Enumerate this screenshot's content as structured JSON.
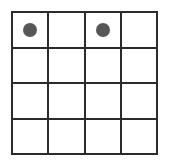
{
  "figure": {
    "title": "",
    "type": "grid-with-markers",
    "rows": 4,
    "columns": 4,
    "background_color": "#ffffff",
    "grid_line_color": "#2b2b2b",
    "grid_line_width_px": 2,
    "marker": {
      "shape": "circle",
      "color": "#575757",
      "diameter_px": 14,
      "count": 2
    },
    "cells": [
      [
        {
          "marker": true
        },
        {
          "marker": false
        },
        {
          "marker": true
        },
        {
          "marker": false
        }
      ],
      [
        {
          "marker": false
        },
        {
          "marker": false
        },
        {
          "marker": false
        },
        {
          "marker": false
        }
      ],
      [
        {
          "marker": false
        },
        {
          "marker": false
        },
        {
          "marker": false
        },
        {
          "marker": false
        }
      ],
      [
        {
          "marker": false
        },
        {
          "marker": false
        },
        {
          "marker": false
        },
        {
          "marker": false
        }
      ]
    ]
  }
}
